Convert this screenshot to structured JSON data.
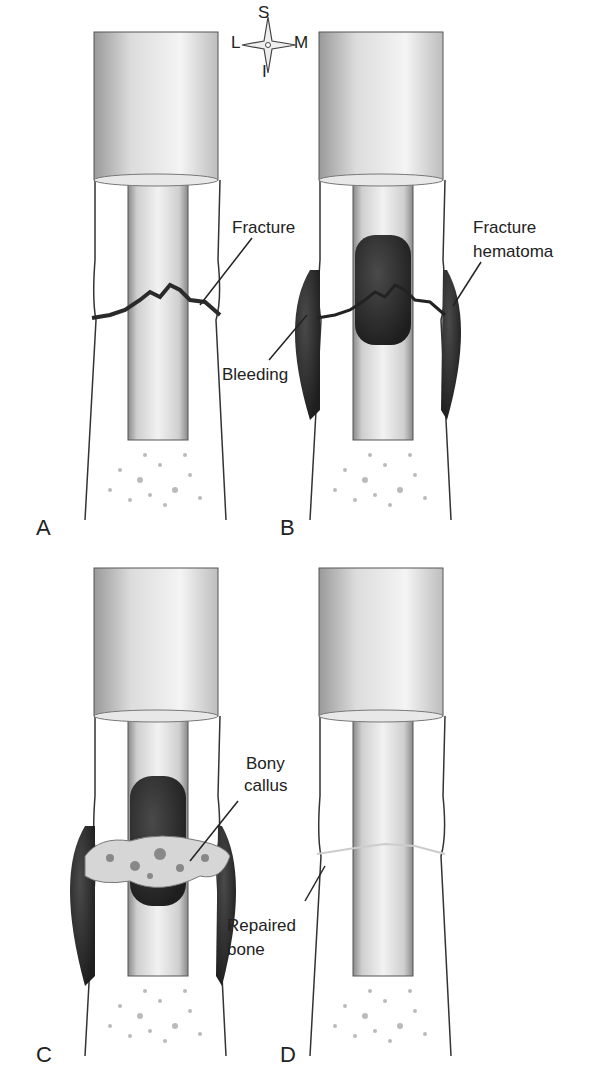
{
  "figure": {
    "compass": {
      "superior": "S",
      "inferior": "I",
      "lateral": "L",
      "medial": "M"
    },
    "panels": [
      {
        "id": "A",
        "label": "A",
        "callouts": [
          {
            "text": "Fracture"
          }
        ]
      },
      {
        "id": "B",
        "label": "B",
        "callouts": [
          {
            "text": "Fracture\nhematoma",
            "line1": "Fracture",
            "line2": "hematoma"
          },
          {
            "text": "Bleeding"
          }
        ]
      },
      {
        "id": "C",
        "label": "C",
        "callouts": [
          {
            "text": "Bony callus",
            "line1": "Bony",
            "line2": "callus"
          }
        ]
      },
      {
        "id": "D",
        "label": "D",
        "callouts": [
          {
            "text": "Repaired bone",
            "line1": "Repaired",
            "line2": "bone"
          }
        ]
      }
    ]
  },
  "colors": {
    "bone_outline": "#333333",
    "hematoma": "#2a2a2a",
    "shaft": "#d8d8d8",
    "background": "#ffffff"
  }
}
